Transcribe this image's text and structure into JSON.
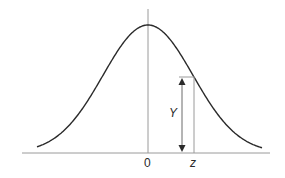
{
  "diagram": {
    "title": "",
    "type": "normal-distribution-curve",
    "labels": {
      "origin": "0",
      "z": "z",
      "y": "Y"
    },
    "colors": {
      "curve": "#2a2a2a",
      "axis": "#9a9a9a",
      "arrow": "#2a2a2a",
      "background": "#ffffff"
    },
    "geometry": {
      "baseline_y": 153,
      "baseline_x_start": 22,
      "baseline_x_end": 270,
      "axis_x": 148,
      "axis_top_y": 9,
      "peak_y": 25,
      "z_x": 194,
      "curve_at_z_y": 77,
      "arrow_x": 182
    }
  }
}
